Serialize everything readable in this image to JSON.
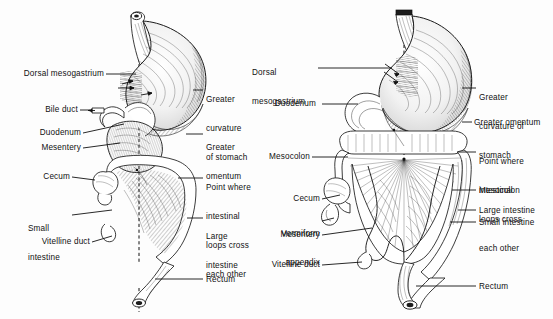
{
  "figure": {
    "style": "pen-and-ink line engraving, black on white",
    "background_color": "#fdfdfd",
    "ink_color": "#111111",
    "panel_count": 2
  },
  "panels": [
    {
      "id": "left-panel",
      "name": "earlier-stage",
      "midline_axis": "vertical dashed line through esophagus and rectum",
      "labels_left": [
        {
          "id": "l-dorsal-mesogastrium",
          "text": "Dorsal mesogastrium",
          "lines": [
            "Dorsal mesogastrium"
          ]
        },
        {
          "id": "l-bile-duct",
          "text": "Bile duct",
          "lines": [
            "Bile duct"
          ]
        },
        {
          "id": "l-duodenum",
          "text": "Duodenum",
          "lines": [
            "Duodenum"
          ]
        },
        {
          "id": "l-mesentery",
          "text": "Mesentery",
          "lines": [
            "Mesentery"
          ]
        },
        {
          "id": "l-cecum",
          "text": "Cecum",
          "lines": [
            "Cecum"
          ]
        },
        {
          "id": "l-small-intestine",
          "text": "Small intestine",
          "lines": [
            "Small",
            "intestine"
          ]
        },
        {
          "id": "l-vitelline-duct",
          "text": "Vitelline duct",
          "lines": [
            "Vitelline duct"
          ]
        }
      ],
      "labels_right": [
        {
          "id": "l-greater-curvature",
          "text": "Greater curvature of stomach",
          "lines": [
            "Greater",
            "curvature",
            "of stomach"
          ]
        },
        {
          "id": "l-greater-omentum",
          "text": "Greater omentum",
          "lines": [
            "Greater",
            "omentum"
          ]
        },
        {
          "id": "l-point-where",
          "text": "Point where intestinal loops cross each other",
          "lines": [
            "Point where",
            "intestinal",
            "loops cross",
            "each other"
          ]
        },
        {
          "id": "l-large-intestine",
          "text": "Large intestine",
          "lines": [
            "Large",
            "intestine"
          ]
        },
        {
          "id": "l-rectum",
          "text": "Rectum",
          "lines": [
            "Rectum"
          ]
        }
      ]
    },
    {
      "id": "right-panel",
      "name": "later-stage",
      "midline_axis": "vertical dashed line through esophagus and rectum",
      "labels_left": [
        {
          "id": "r-dorsal-mesogastrium",
          "text": "Dorsal mesogastrium",
          "lines": [
            "Dorsal",
            "mesogastrium"
          ]
        },
        {
          "id": "r-duodenum",
          "text": "Duodenum",
          "lines": [
            "Duodenum"
          ]
        },
        {
          "id": "r-mesocolon",
          "text": "Mesocolon",
          "lines": [
            "Mesocolon"
          ]
        },
        {
          "id": "r-cecum",
          "text": "Cecum",
          "lines": [
            "Cecum"
          ]
        },
        {
          "id": "r-vermiform-appendix",
          "text": "Vermiform appendix",
          "lines": [
            "Vermiform",
            "appendix"
          ]
        },
        {
          "id": "r-mesentery",
          "text": "Mesentery",
          "lines": [
            "Mesentery"
          ]
        },
        {
          "id": "r-vitelline-duct",
          "text": "Vitelline duct",
          "lines": [
            "Vitelline duct"
          ]
        }
      ],
      "labels_right": [
        {
          "id": "r-greater-curvature",
          "text": "Greater curvature of stomach",
          "lines": [
            "Greater",
            "curvature of",
            "stomach"
          ]
        },
        {
          "id": "r-greater-omentum",
          "text": "Greater omentum",
          "lines": [
            "Greater omentum"
          ]
        },
        {
          "id": "r-point-where",
          "text": "Point where intestinal loops cross each other",
          "lines": [
            "Point where",
            "intestinal",
            "loops cross",
            "each other"
          ]
        },
        {
          "id": "r-mesocolon-2",
          "text": "Mesocolon",
          "lines": [
            "Mesocolon"
          ]
        },
        {
          "id": "r-large-intestine",
          "text": "Large intestine",
          "lines": [
            "Large intestine"
          ]
        },
        {
          "id": "r-small-intestine",
          "text": "Small intestine",
          "lines": [
            "Small intestine"
          ]
        },
        {
          "id": "r-rectum",
          "text": "Rectum",
          "lines": [
            "Rectum"
          ]
        }
      ]
    }
  ],
  "left": {
    "dorsal_mesogastrium": "Dorsal mesogastrium",
    "bile_duct": "Bile duct",
    "duodenum": "Duodenum",
    "mesentery": "Mesentery",
    "cecum": "Cecum",
    "small_intestine_1": "Small",
    "small_intestine_2": "intestine",
    "vitelline_duct": "Vitelline duct",
    "greater_curv_1": "Greater",
    "greater_curv_2": "curvature",
    "greater_curv_3": "of stomach",
    "greater_omentum_1": "Greater",
    "greater_omentum_2": "omentum",
    "point_1": "Point where",
    "point_2": "intestinal",
    "point_3": "loops cross",
    "point_4": "each other",
    "large_intestine_1": "Large",
    "large_intestine_2": "intestine",
    "rectum": "Rectum"
  },
  "right": {
    "dorsal_mesogastrium_1": "Dorsal",
    "dorsal_mesogastrium_2": "mesogastrium",
    "duodenum": "Duodenum",
    "mesocolon": "Mesocolon",
    "cecum": "Cecum",
    "vermiform_1": "Vermiform",
    "vermiform_2": "appendix",
    "mesentery": "Mesentery",
    "vitelline_duct": "Vitelline duct",
    "greater_curv_1": "Greater",
    "greater_curv_2": "curvature of",
    "greater_curv_3": "stomach",
    "greater_omentum": "Greater omentum",
    "point_1": "Point where",
    "point_2": "intestinal",
    "point_3": "loops cross",
    "point_4": "each other",
    "mesocolon_2": "Mesocolon",
    "large_intestine": "Large intestine",
    "small_intestine": "Small intestine",
    "rectum": "Rectum"
  }
}
